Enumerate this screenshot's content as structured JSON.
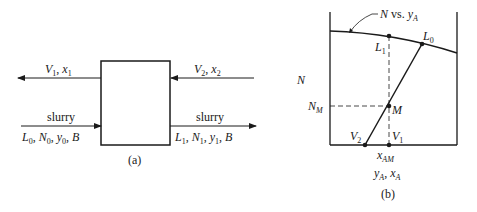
{
  "panel_a": {
    "caption": "(a)",
    "top_left_stream": {
      "symbol": "V",
      "sub": "1",
      "sep": ", ",
      "symbol2": "x",
      "sub2": "1"
    },
    "top_right_stream": {
      "symbol": "V",
      "sub": "2",
      "sep": ", ",
      "symbol2": "x",
      "sub2": "2"
    },
    "bottom_left_stream": {
      "title": "slurry",
      "parts": [
        "L",
        "0",
        "N",
        "0",
        "y",
        "0",
        "B"
      ]
    },
    "bottom_right_stream": {
      "title": "slurry",
      "parts": [
        "L",
        "1",
        "N",
        "1",
        "y",
        "1",
        "B"
      ]
    }
  },
  "panel_b": {
    "caption": "(b)",
    "curve_label": {
      "N": "N",
      "vs": " vs. ",
      "y": "y",
      "sub": "A"
    },
    "y_axis_label": "N",
    "x_axis_label": {
      "y": "y",
      "ysub": "A",
      "sep": ", ",
      "x": "x",
      "xsub": "A"
    },
    "points": {
      "L1": {
        "sym": "L",
        "sub": "1"
      },
      "L0": {
        "sym": "L",
        "sub": "0"
      },
      "M": {
        "sym": "M"
      },
      "V2": {
        "sym": "V",
        "sub": "2"
      },
      "V1": {
        "sym": "V",
        "sub": "1"
      },
      "NM": {
        "sym": "N",
        "sub": "M"
      },
      "xAM": {
        "sym": "x",
        "sub": "AM"
      }
    }
  },
  "colors": {
    "ink": "#1a1a1a",
    "background": "#ffffff"
  }
}
